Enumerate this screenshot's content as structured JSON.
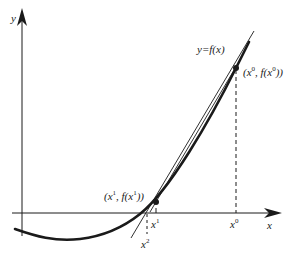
{
  "diagram": {
    "axes": {
      "x_label": "x",
      "y_label": "y"
    },
    "curve_label": "y=f(x)",
    "points": [
      {
        "id": "p0",
        "name": "x",
        "sup": "0",
        "label_prefix": "(x",
        "label_mid": ", f(x",
        "label_suffix": "))"
      },
      {
        "id": "p1",
        "name": "x",
        "sup": "1",
        "label_prefix": "(x",
        "label_mid": ", f(x",
        "label_suffix": "))"
      }
    ],
    "ticks": [
      {
        "id": "x1",
        "base": "x",
        "sup": "1"
      },
      {
        "id": "x0",
        "base": "x",
        "sup": "0"
      },
      {
        "id": "x2",
        "base": "x",
        "sup": "2"
      }
    ],
    "colors": {
      "stroke": "#1a1a1a",
      "background": "#ffffff"
    }
  }
}
